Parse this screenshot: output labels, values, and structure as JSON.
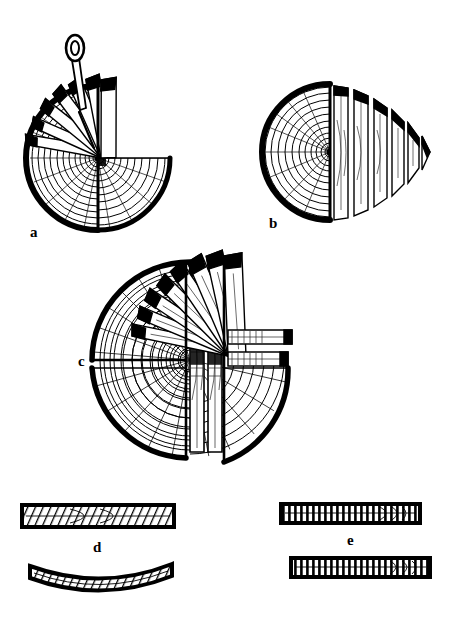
{
  "figure": {
    "background_color": "#ffffff",
    "ink_color": "#000000",
    "width": 450,
    "height": 618,
    "style": "black-and-white line engraving"
  },
  "panels": [
    {
      "id": "a",
      "label": "a",
      "label_x": 30,
      "label_y": 237,
      "name": "radial-sawing-half-log",
      "description": "Log cross-section half sawn into radial boards fanned out from the pith, with a marking awl",
      "center_x": 98,
      "center_y": 158,
      "radius": 72,
      "ring_count": 13,
      "fan_board_count": 7,
      "has_tool": true,
      "tool_name": "marking-awl"
    },
    {
      "id": "b",
      "label": "b",
      "label_x": 269,
      "label_y": 228,
      "name": "tangential-parallel-sawing",
      "description": "Half log sliced by parallel vertical cuts into boards of decreasing width",
      "center_x": 330,
      "center_y": 152,
      "radius": 68,
      "ring_count": 13,
      "slice_count": 6
    },
    {
      "id": "c",
      "label": "c",
      "label_x": 78,
      "label_y": 360,
      "name": "quarter-sawing-combined",
      "description": "Quartered log with two central boards through the pith, a fan of radial boards and two horizontal boards",
      "center_x": 190,
      "center_y": 360,
      "radius": 98,
      "ring_count": 14,
      "center_board_count": 2,
      "fan_board_count": 8,
      "horizontal_board_count": 2
    },
    {
      "id": "d",
      "label": "d",
      "label_x": 93,
      "label_y": 552,
      "name": "flatsawn-board-cupping",
      "description": "Flat-sawn board with diagonal grain shown straight above and cupped after drying below",
      "boards": [
        {
          "name": "flatsawn-board-straight",
          "x": 22,
          "y": 505,
          "width": 152,
          "height": 22,
          "state": "straight",
          "grain": "diagonal"
        },
        {
          "name": "flatsawn-board-cupped",
          "x": 30,
          "y": 566,
          "width": 142,
          "height": 20,
          "state": "cupped",
          "grain": "diagonal"
        }
      ]
    },
    {
      "id": "e",
      "label": "e",
      "label_x": 347,
      "label_y": 545,
      "name": "quartersawn-board-stable",
      "description": "Quarter-sawn boards with vertical grain that remain flat after drying",
      "boards": [
        {
          "name": "quartersawn-board-upper",
          "x": 281,
          "y": 504,
          "width": 139,
          "height": 19,
          "state": "straight",
          "grain": "vertical"
        },
        {
          "name": "quartersawn-board-lower",
          "x": 291,
          "y": 558,
          "width": 139,
          "height": 19,
          "state": "straight",
          "grain": "vertical"
        }
      ]
    }
  ]
}
